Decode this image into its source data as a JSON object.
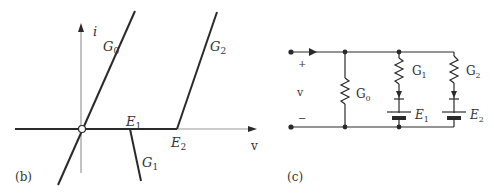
{
  "panel_b": {
    "caption": "(b)",
    "axis_y_label": "i",
    "axis_x_label": "v",
    "labels": {
      "G0": {
        "main": "G",
        "sub": "0"
      },
      "G1": {
        "main": "G",
        "sub": "1"
      },
      "G2": {
        "main": "G",
        "sub": "2"
      },
      "E1": {
        "main": "E",
        "sub": "1"
      },
      "E2": {
        "main": "E",
        "sub": "2"
      }
    }
  },
  "panel_c": {
    "caption": "(c)",
    "plus": "+",
    "minus": "−",
    "voltage": "v",
    "labels": {
      "G0": {
        "main": "G",
        "sub": "0"
      },
      "G1": {
        "main": "G",
        "sub": "1"
      },
      "G2": {
        "main": "G",
        "sub": "2"
      },
      "E1": {
        "main": "E",
        "sub": "1"
      },
      "E2": {
        "main": "E",
        "sub": "2"
      }
    }
  },
  "colors": {
    "line": "#2a2a2a",
    "axis": "#9a9a9a"
  }
}
